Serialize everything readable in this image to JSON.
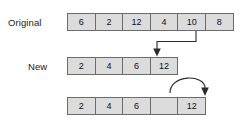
{
  "diagram": {
    "rows": [
      {
        "label": "Original",
        "cells": [
          "6",
          "2",
          "12",
          "4",
          "10",
          "8"
        ]
      },
      {
        "label": "New",
        "cells": [
          "2",
          "4",
          "6",
          "12"
        ]
      },
      {
        "label": "",
        "cells": [
          "2",
          "4",
          "6",
          "",
          "12"
        ]
      }
    ],
    "arrows": [
      {
        "name": "elbow-arrow-original-to-new",
        "kind": "elbow",
        "from_value": "10",
        "to_index": 3,
        "direction": "down"
      },
      {
        "name": "curved-arrow-shift-twelve",
        "kind": "curved",
        "from_value": "12",
        "to_index": 4,
        "direction": "down"
      }
    ],
    "colors": {
      "cell_fill": "#dcdcdc",
      "cell_border": "#6b6b6b",
      "text": "#111111",
      "arrow": "#2b2b2b",
      "background": "#ffffff"
    }
  }
}
